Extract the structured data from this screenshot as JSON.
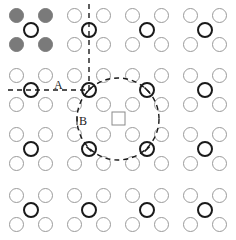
{
  "figure": {
    "width": 236,
    "height": 240,
    "grid": {
      "rows": 4,
      "cols": 4,
      "cell_centers_x": [
        31,
        89,
        147,
        205
      ],
      "cell_centers_y": [
        30,
        90,
        149,
        210
      ],
      "corner_offset": 14.5,
      "circle_radius": 7
    },
    "colors": {
      "outline_circle": "#9a9a9a",
      "bold_circle": "#1a1a1a",
      "filled_circle": "#7a7a7a",
      "dashed_line": "#1a1a1a",
      "square": "#8a8a8a"
    },
    "filled_cell": {
      "row": 0,
      "col": 0
    },
    "labels": [
      {
        "text": "A",
        "x": 58,
        "y": 88
      },
      {
        "text": "B",
        "x": 80,
        "y": 125
      }
    ],
    "dashed_circle": {
      "cx": 118,
      "cy": 119,
      "r": 41
    },
    "center_square": {
      "x": 112,
      "y": 112,
      "size": 13
    },
    "dashed_lines": {
      "vertical": {
        "x": 89,
        "y1": 4,
        "y2": 90
      },
      "horizontal": {
        "x1": 8,
        "x2": 89,
        "y": 90
      }
    }
  }
}
